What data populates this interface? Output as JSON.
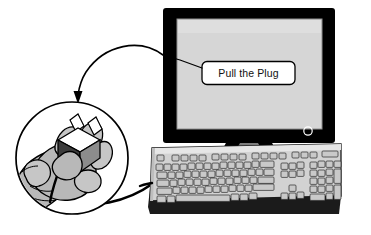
{
  "illustration": {
    "title": "Pull the Plug",
    "description": "Line-art illustration of a CRT computer monitor and keyboard with a magnified circular callout of a hand pulling an electrical power plug",
    "background_color": "#ffffff",
    "line_color": "#000000"
  },
  "monitor": {
    "label": "computer-monitor",
    "bezel_color": "#000000",
    "screen_color": "#d6d6d6",
    "screen_border_color": "#8f8f8f",
    "power_led": {
      "label": "power-indicator",
      "shape": "circle",
      "color": "#ffffff"
    },
    "stand": {
      "label": "monitor-stand",
      "color": "#7d7d7d"
    },
    "screen_message": {
      "label": "screen-callout-box",
      "text": "Pull the Plug",
      "box_fill": "#ffffff",
      "box_stroke": "#000000",
      "text_color": "#111111"
    }
  },
  "keyboard": {
    "label": "computer-keyboard",
    "body_color": "#d2d2d2",
    "body_top_color": "#e6e6e6",
    "base_color": "#1b1b1b",
    "key_fill": "#c9c9c9",
    "key_shadow": "#8a8a8a",
    "key_stroke": "#2a2a2a",
    "clusters": [
      {
        "name": "escape-key",
        "keys": 1
      },
      {
        "name": "function-keys-f1-f4",
        "keys": 4
      },
      {
        "name": "function-keys-f5-f8",
        "keys": 4
      },
      {
        "name": "function-keys-f9-f12",
        "keys": 4
      },
      {
        "name": "system-keys",
        "keys": 3
      },
      {
        "name": "led-strip",
        "keys": 1
      },
      {
        "name": "main-typing-area",
        "keys": 61
      },
      {
        "name": "navigation-cluster",
        "keys": 6
      },
      {
        "name": "arrow-keys",
        "keys": 4
      },
      {
        "name": "numeric-keypad",
        "keys": 17
      }
    ]
  },
  "magnifier": {
    "label": "magnified-circle-callout",
    "stroke_color": "#000000",
    "fill_color": "#ffffff"
  },
  "hand": {
    "label": "hand-holding-plug",
    "skin_fill": "#b8b8b8",
    "skin_highlight": "#e2e2e2",
    "outline": "#000000"
  },
  "plug": {
    "label": "electrical-power-plug",
    "body_top_color": "#ffffff",
    "body_side_color": "#3c3c3c",
    "body_front_color": "#8c8c8c",
    "prong_color": "#ffffff",
    "prong_count": 2
  },
  "cable": {
    "label": "power-cable",
    "color": "#000000",
    "description": "cable running from the plug callout to the keyboard"
  },
  "pointer_arrow": {
    "label": "callout-arrow",
    "color": "#000000",
    "description": "curved arrow from the screen message down to the magnified circle"
  },
  "leader_line": {
    "label": "callout-leader-line",
    "color": "#000000"
  }
}
